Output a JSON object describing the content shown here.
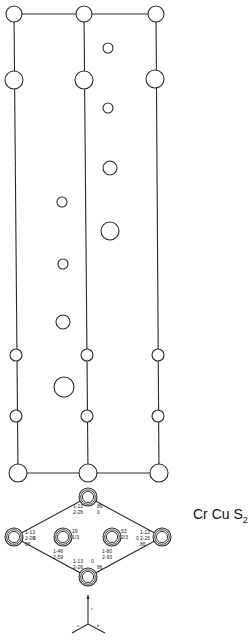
{
  "figure": {
    "formula": {
      "elements": "Cr Cu S",
      "subscript": "2"
    },
    "side_view": {
      "column_x": [
        14,
        85,
        156
      ],
      "column_lines": [
        {
          "x1": 14,
          "y1": 14,
          "x2": 18,
          "y2": 473
        },
        {
          "x1": 84,
          "y1": 14,
          "x2": 88,
          "y2": 473
        },
        {
          "x1": 156,
          "y1": 14,
          "x2": 159,
          "y2": 473
        }
      ],
      "horizontal_lines": [
        {
          "x1": 14,
          "y1": 14,
          "x2": 156,
          "y2": 14
        },
        {
          "x1": 18,
          "y1": 473,
          "x2": 159,
          "y2": 473
        }
      ],
      "atoms": [
        {
          "x": 14,
          "y": 14,
          "r": 8
        },
        {
          "x": 84,
          "y": 14,
          "r": 8
        },
        {
          "x": 156,
          "y": 14,
          "r": 8
        },
        {
          "x": 108,
          "y": 48,
          "r": 5
        },
        {
          "x": 14,
          "y": 80,
          "r": 9
        },
        {
          "x": 84,
          "y": 80,
          "r": 9
        },
        {
          "x": 155,
          "y": 79,
          "r": 9
        },
        {
          "x": 108,
          "y": 108,
          "r": 5
        },
        {
          "x": 110,
          "y": 168,
          "r": 7
        },
        {
          "x": 62,
          "y": 202,
          "r": 5
        },
        {
          "x": 110,
          "y": 231,
          "r": 9
        },
        {
          "x": 63,
          "y": 264,
          "r": 5
        },
        {
          "x": 63,
          "y": 322,
          "r": 7
        },
        {
          "x": 16,
          "y": 355,
          "r": 6
        },
        {
          "x": 87,
          "y": 355,
          "r": 6
        },
        {
          "x": 158,
          "y": 355,
          "r": 6
        },
        {
          "x": 64,
          "y": 387,
          "r": 10
        },
        {
          "x": 16,
          "y": 416,
          "r": 6
        },
        {
          "x": 87,
          "y": 416,
          "r": 6
        },
        {
          "x": 158,
          "y": 416,
          "r": 6
        },
        {
          "x": 18,
          "y": 473,
          "r": 9
        },
        {
          "x": 88,
          "y": 473,
          "r": 9
        },
        {
          "x": 159,
          "y": 473,
          "r": 9
        }
      ]
    },
    "top_view": {
      "sites": [
        {
          "name": "top",
          "x": 88,
          "y": 497,
          "labels": [
            "1-13",
            "2-26",
            "86",
            "0"
          ]
        },
        {
          "name": "left",
          "x": 14,
          "y": 537,
          "labels": [
            "1-13",
            "2-26",
            "0",
            "86"
          ]
        },
        {
          "name": "inner-left",
          "x": 63,
          "y": 537,
          "labels": [
            "19",
            "1/3",
            "1-46",
            "2-59"
          ]
        },
        {
          "name": "inner-right",
          "x": 112,
          "y": 537,
          "labels": [
            "53",
            "2/3",
            "1-80",
            "2-93"
          ]
        },
        {
          "name": "right",
          "x": 162,
          "y": 537,
          "labels": [
            "1-13",
            "2-26",
            "0",
            "86"
          ]
        },
        {
          "name": "bottom",
          "x": 88,
          "y": 577,
          "labels": [
            "1-13",
            "2-26",
            "0",
            "86"
          ]
        }
      ]
    },
    "axes": {
      "c": "c",
      "a": "a",
      "b": "b"
    }
  }
}
